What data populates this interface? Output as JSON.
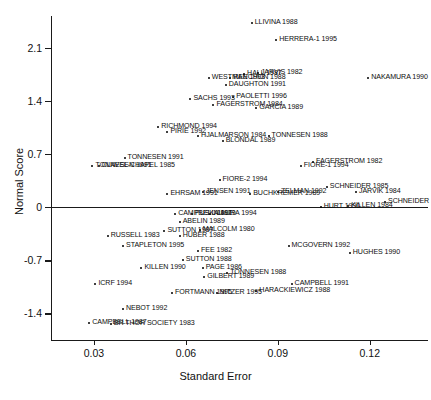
{
  "chart_data": {
    "type": "scatter",
    "title": "",
    "xlabel": "Standard Error",
    "ylabel": "Normal Score",
    "xlim": [
      0.016,
      0.139
    ],
    "ylim": [
      -1.75,
      2.52
    ],
    "xticks": [
      0.03,
      0.06,
      0.09,
      0.12
    ],
    "xtick_labels": [
      "0.03",
      "0.06",
      "0.09",
      "0.12"
    ],
    "yticks": [
      -1.4,
      -0.7,
      0,
      0.7,
      1.4,
      2.1
    ],
    "ytick_labels": [
      "-1.4",
      "-0.7",
      "0",
      "0.7",
      "1.4",
      "2.1"
    ],
    "grid": false,
    "legend": false,
    "reference_lines": [
      {
        "axis": "y",
        "value": 0
      }
    ],
    "points": [
      {
        "label": "LLIVINA 1988",
        "x": 0.0815,
        "y": 2.43,
        "side": "right"
      },
      {
        "label": "HERRERA-1 1995",
        "x": 0.0895,
        "y": 2.2,
        "side": "right"
      },
      {
        "label": "WESTMAN 1993",
        "x": 0.0675,
        "y": 1.7,
        "side": "right"
      },
      {
        "label": "HALL 1987",
        "x": 0.079,
        "y": 1.755,
        "side": "right"
      },
      {
        "label": "JARVIS 1982",
        "x": 0.0835,
        "y": 1.775,
        "side": "right"
      },
      {
        "label": "REECHON 1988",
        "x": 0.0745,
        "y": 1.7,
        "side": "right"
      },
      {
        "label": "NAKAMURA 1990",
        "x": 0.1195,
        "y": 1.7,
        "side": "right"
      },
      {
        "label": "DAUGHTON 1991",
        "x": 0.073,
        "y": 1.615,
        "side": "right"
      },
      {
        "label": "SACHS 1993",
        "x": 0.0615,
        "y": 1.425,
        "side": "right"
      },
      {
        "label": "PAOLETTI 1996",
        "x": 0.0755,
        "y": 1.45,
        "side": "right"
      },
      {
        "label": "FAGERSTROM 1984",
        "x": 0.069,
        "y": 1.345,
        "side": "right"
      },
      {
        "label": "GARCIA 1989",
        "x": 0.083,
        "y": 1.31,
        "side": "right"
      },
      {
        "label": "RICHMOND 1994",
        "x": 0.051,
        "y": 1.055,
        "side": "right"
      },
      {
        "label": "PIRIE 1992",
        "x": 0.054,
        "y": 0.995,
        "side": "right"
      },
      {
        "label": "HJALMARSON 1984",
        "x": 0.064,
        "y": 0.945,
        "side": "right"
      },
      {
        "label": "BLONDAL 1989",
        "x": 0.072,
        "y": 0.875,
        "side": "right"
      },
      {
        "label": "TONNESEN 1988",
        "x": 0.087,
        "y": 0.945,
        "side": "right"
      },
      {
        "label": "TONNESEN 1991",
        "x": 0.04,
        "y": 0.655,
        "side": "right"
      },
      {
        "label": "TONNESEN 1991",
        "x": 0.0295,
        "y": 0.545,
        "side": "right"
      },
      {
        "label": "CLAVEL-CHAPEL 1985",
        "x": 0.0315,
        "y": 0.545,
        "side": "right"
      },
      {
        "label": "FAGERSTROM 1982",
        "x": 0.1015,
        "y": 0.595,
        "side": "right"
      },
      {
        "label": "FIORE-1 1994",
        "x": 0.0975,
        "y": 0.545,
        "side": "right"
      },
      {
        "label": "FIORE-2 1994",
        "x": 0.071,
        "y": 0.355,
        "side": "right"
      },
      {
        "label": "SCHNEIDER 1985",
        "x": 0.106,
        "y": 0.265,
        "side": "right"
      },
      {
        "label": "JARVIK 1984",
        "x": 0.1155,
        "y": 0.205,
        "side": "right"
      },
      {
        "label": "EHRSAM 1991",
        "x": 0.054,
        "y": 0.175,
        "side": "right"
      },
      {
        "label": "JENSEN 1991",
        "x": 0.0655,
        "y": 0.205,
        "side": "right"
      },
      {
        "label": "BUCHKREMER 1989",
        "x": 0.081,
        "y": 0.175,
        "side": "right"
      },
      {
        "label": "ZELMAN 1992",
        "x": 0.09,
        "y": 0.195,
        "side": "right"
      },
      {
        "label": "SCHNEIDER",
        "x": 0.125,
        "y": 0.075,
        "side": "right"
      },
      {
        "label": "HURT 1990",
        "x": 0.104,
        "y": 0.005,
        "side": "right"
      },
      {
        "label": "KILLEN 1984",
        "x": 0.113,
        "y": 0.015,
        "side": "right"
      },
      {
        "label": "CAMPBELL 1991",
        "x": 0.0565,
        "y": -0.095,
        "side": "right"
      },
      {
        "label": "PUSKA 1979",
        "x": 0.062,
        "y": -0.085,
        "side": "right"
      },
      {
        "label": "NIAURA 1994",
        "x": 0.068,
        "y": -0.095,
        "side": "right"
      },
      {
        "label": "ABELIN 1989",
        "x": 0.058,
        "y": -0.195,
        "side": "right"
      },
      {
        "label": "SUTTON 1987",
        "x": 0.053,
        "y": -0.315,
        "side": "right"
      },
      {
        "label": "MALCOLM 1980",
        "x": 0.0645,
        "y": -0.305,
        "side": "right"
      },
      {
        "label": "RUSSELL 1983",
        "x": 0.0345,
        "y": -0.375,
        "side": "right"
      },
      {
        "label": "HUBER 1988",
        "x": 0.058,
        "y": -0.375,
        "side": "right"
      },
      {
        "label": "STAPLETON 1995",
        "x": 0.0395,
        "y": -0.505,
        "side": "right"
      },
      {
        "label": "MCGOVERN 1992",
        "x": 0.0935,
        "y": -0.505,
        "side": "right"
      },
      {
        "label": "FEE 1982",
        "x": 0.064,
        "y": -0.575,
        "side": "right"
      },
      {
        "label": "SUTTON 1988",
        "x": 0.059,
        "y": -0.695,
        "side": "right"
      },
      {
        "label": "KILLEN 1990",
        "x": 0.0455,
        "y": -0.795,
        "side": "right"
      },
      {
        "label": "PAGE 1986",
        "x": 0.0655,
        "y": -0.805,
        "side": "right"
      },
      {
        "label": "TONNESEN 1988",
        "x": 0.0735,
        "y": -0.865,
        "side": "right"
      },
      {
        "label": "GILBERT 1989",
        "x": 0.066,
        "y": -0.915,
        "side": "right"
      },
      {
        "label": "ICRF 1994",
        "x": 0.0305,
        "y": -1.015,
        "side": "right"
      },
      {
        "label": "CAMPBELL 1991",
        "x": 0.0945,
        "y": -1.015,
        "side": "right"
      },
      {
        "label": "FORTMANN 1995",
        "x": 0.0555,
        "y": -1.135,
        "side": "right"
      },
      {
        "label": "NITZER 1995",
        "x": 0.07,
        "y": -1.135,
        "side": "right"
      },
      {
        "label": "HARACKIEWICZ 1988",
        "x": 0.083,
        "y": -1.105,
        "side": "right"
      },
      {
        "label": "HUGHES 1990",
        "x": 0.1135,
        "y": -0.605,
        "side": "right"
      },
      {
        "label": "NEBOT 1992",
        "x": 0.0395,
        "y": -1.345,
        "side": "right"
      },
      {
        "label": "CAMPBELL 1987",
        "x": 0.0285,
        "y": -1.525,
        "side": "right"
      },
      {
        "label": "BR THOR SOCIETY 1983",
        "x": 0.0355,
        "y": -1.535,
        "side": "right"
      }
    ]
  }
}
